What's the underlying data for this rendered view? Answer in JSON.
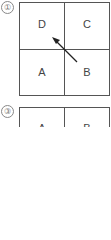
{
  "panels": [
    {
      "number": "①",
      "cells": {
        "top_left": "D",
        "top_right": "C",
        "bottom_left": "A",
        "bottom_right": "B"
      },
      "arrow": {
        "from": "B",
        "to": "D"
      }
    },
    {
      "number": "③",
      "cells": {
        "bottom_left": "A",
        "bottom_right": "B"
      }
    }
  ]
}
